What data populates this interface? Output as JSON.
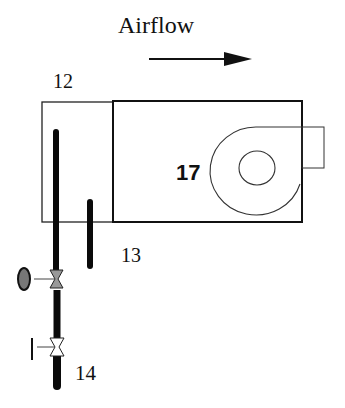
{
  "title": "Airflow",
  "labels": {
    "heat_exchanger": "12",
    "inner_pipe": "13",
    "supply_line": "14",
    "fan": "17"
  },
  "colors": {
    "line": "#111111",
    "pipe": "#0a0a0a",
    "gauge_fill": "#777777",
    "background": "#ffffff"
  },
  "components": [
    {
      "id": "12",
      "name": "heat exchanger section"
    },
    {
      "id": "13",
      "name": "pipe"
    },
    {
      "id": "14",
      "name": "supply line with valves"
    },
    {
      "id": "17",
      "name": "centrifugal fan / blower"
    }
  ]
}
